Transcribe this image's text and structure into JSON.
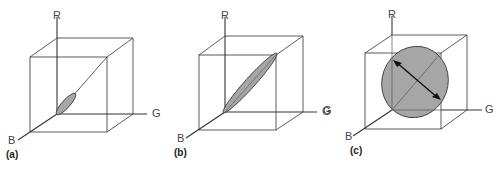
{
  "figure": {
    "panels": [
      {
        "id": "a",
        "label": "(a)",
        "axes": {
          "r": "R",
          "g": "G",
          "b": "B"
        },
        "shape": "small ellipsoid along gray diagonal near origin"
      },
      {
        "id": "b",
        "label": "(b)",
        "axes": {
          "r": "R",
          "g": "G",
          "b": "B"
        },
        "shape": "elongated ellipsoid along full gray diagonal"
      },
      {
        "id": "c",
        "label": "(c)",
        "axes": {
          "r": "R",
          "g": "G",
          "b": "B"
        },
        "shape": "large ellipse with double-headed arrow across diagonal"
      }
    ],
    "stray_label": "G",
    "colors": {
      "ellipse_fill": "#a6a6a6",
      "line": "#333333",
      "background": "#ffffff"
    }
  }
}
